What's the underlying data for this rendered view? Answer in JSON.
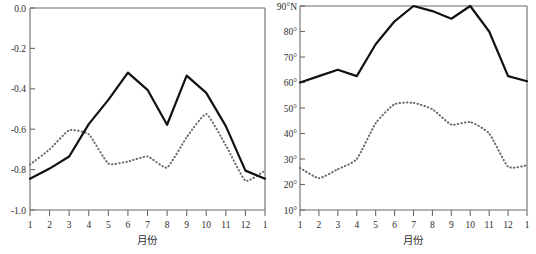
{
  "figure": {
    "panels": [
      "left",
      "right"
    ],
    "background": "#ffffff",
    "line_colors": {
      "solid": "#111111",
      "dotted": "#6a6a6a"
    }
  },
  "left_panel": {
    "xlabel": "月份",
    "y_ticks": [
      "0.0",
      "-0.2",
      "-0.4",
      "-0.6",
      "-0.8",
      "-1.0"
    ],
    "x_ticks": [
      "1",
      "2",
      "3",
      "4",
      "5",
      "6",
      "7",
      "8",
      "9",
      "10",
      "11",
      "12",
      "1"
    ]
  },
  "right_panel": {
    "xlabel": "月份",
    "y_ticks": [
      "90°N",
      "80°",
      "70°",
      "60°",
      "50°",
      "40°",
      "30°",
      "20°",
      "10°"
    ],
    "x_ticks": [
      "1",
      "2",
      "3",
      "4",
      "5",
      "6",
      "7",
      "8",
      "9",
      "10",
      "11",
      "12",
      "1"
    ]
  },
  "caption": {
    "text": ""
  },
  "chart_data": [
    {
      "type": "line",
      "id": "left-panel",
      "title": "",
      "xlabel": "月份",
      "ylabel": "",
      "xlim": [
        1,
        13
      ],
      "ylim": [
        -1.0,
        0.0
      ],
      "yticks": [
        0.0,
        -0.2,
        -0.4,
        -0.6,
        -0.8,
        -1.0
      ],
      "ytick_labels": [
        "0.0",
        "-0.2",
        "-0.4",
        "-0.6",
        "-0.8",
        "-1.0"
      ],
      "xticks": [
        1,
        2,
        3,
        4,
        5,
        6,
        7,
        8,
        9,
        10,
        11,
        12,
        13
      ],
      "xtick_labels": [
        "1",
        "2",
        "3",
        "4",
        "5",
        "6",
        "7",
        "8",
        "9",
        "10",
        "11",
        "12",
        "1"
      ],
      "grid": false,
      "legend": "none",
      "series": [
        {
          "name": "solid",
          "style": "solid",
          "color": "#111111",
          "x": [
            1,
            2,
            3,
            4,
            5,
            6,
            7,
            8,
            9,
            10,
            11,
            12,
            13
          ],
          "values": [
            -0.845,
            -0.795,
            -0.735,
            -0.575,
            -0.455,
            -0.32,
            -0.405,
            -0.578,
            -0.335,
            -0.42,
            -0.585,
            -0.805,
            -0.845
          ]
        },
        {
          "name": "dotted",
          "style": "dotted",
          "color": "#6a6a6a",
          "x": [
            1,
            2,
            3,
            4,
            5,
            6,
            7,
            8,
            9,
            10,
            11,
            12,
            13
          ],
          "values": [
            -0.775,
            -0.7,
            -0.605,
            -0.625,
            -0.77,
            -0.76,
            -0.735,
            -0.79,
            -0.64,
            -0.525,
            -0.68,
            -0.855,
            -0.805
          ]
        }
      ]
    },
    {
      "type": "line",
      "id": "right-panel",
      "title": "",
      "xlabel": "月份",
      "ylabel": "",
      "xlim": [
        1,
        13
      ],
      "ylim": [
        10,
        90
      ],
      "yticks": [
        90,
        80,
        70,
        60,
        50,
        40,
        30,
        20,
        10
      ],
      "ytick_labels": [
        "90°N",
        "80°",
        "70°",
        "60°",
        "50°",
        "40°",
        "30°",
        "20°",
        "10°"
      ],
      "xticks": [
        1,
        2,
        3,
        4,
        5,
        6,
        7,
        8,
        9,
        10,
        11,
        12,
        13
      ],
      "xtick_labels": [
        "1",
        "2",
        "3",
        "4",
        "5",
        "6",
        "7",
        "8",
        "9",
        "10",
        "11",
        "12",
        "1"
      ],
      "grid": false,
      "legend": "none",
      "series": [
        {
          "name": "solid",
          "style": "solid",
          "color": "#111111",
          "x": [
            1,
            2,
            3,
            4,
            5,
            6,
            7,
            8,
            9,
            10,
            11,
            12,
            13
          ],
          "values": [
            60,
            62.5,
            65,
            62.5,
            75,
            84,
            90,
            88,
            85,
            90,
            80,
            62.5,
            60.5
          ]
        },
        {
          "name": "dotted",
          "style": "dotted",
          "color": "#6a6a6a",
          "x": [
            1,
            2,
            3,
            4,
            5,
            6,
            7,
            8,
            9,
            10,
            11,
            12,
            13
          ],
          "values": [
            26.5,
            22.5,
            26,
            30,
            44,
            51.5,
            52,
            49.5,
            43.5,
            44.5,
            40,
            27,
            27.5
          ]
        }
      ]
    }
  ]
}
